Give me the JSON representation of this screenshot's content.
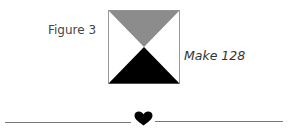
{
  "figure": {
    "label": "Figure 3",
    "quantity_note": "Make 128",
    "block": {
      "type": "hourglass-quarter-square-triangle",
      "top_triangle_color": "#8c8c8c",
      "bottom_triangle_color": "#000000",
      "side_triangle_color": "#ffffff",
      "border_color": "#999999"
    }
  },
  "divider": {
    "ornament": "heart-icon",
    "line_color": "#777777",
    "ornament_color": "#000000"
  }
}
